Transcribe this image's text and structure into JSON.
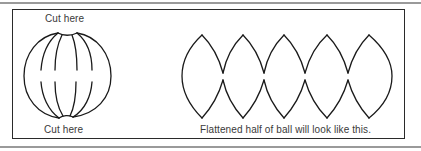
{
  "figure": {
    "ball_diagram": {
      "top_label": "Cut here",
      "bottom_label": "Cut here",
      "description": "Sphere divided into six segments by meridian lines"
    },
    "flattened_diagram": {
      "caption": "Flattened half of ball will look like this.",
      "lobe_count": 5
    }
  },
  "colors": {
    "line": "#1a1a1a",
    "text": "#3a3a3a",
    "frame": "#2a2a2a",
    "rule": "#9a9a9a",
    "background": "#ffffff"
  }
}
